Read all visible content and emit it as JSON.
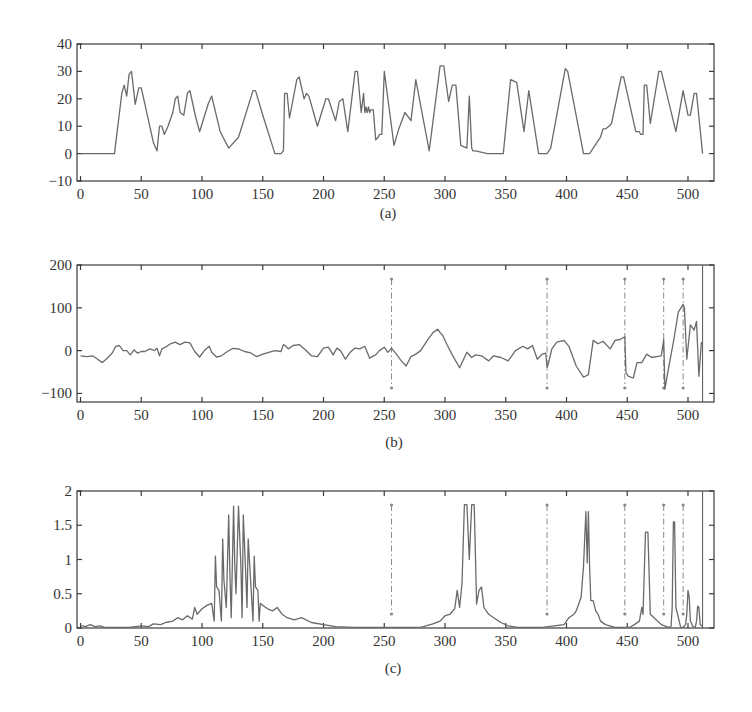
{
  "figure": {
    "panels": [
      "(a)",
      "(b)",
      "(c)"
    ]
  },
  "chart_data": [
    {
      "type": "line",
      "panel_label": "(a)",
      "title": "",
      "xlabel": "",
      "ylabel": "",
      "xlim": [
        -3,
        520
      ],
      "ylim": [
        -10,
        40
      ],
      "xticks": [
        0,
        50,
        100,
        150,
        200,
        250,
        300,
        350,
        400,
        450,
        500
      ],
      "yticks": [
        -10,
        0,
        10,
        20,
        30,
        40
      ],
      "ytick_labels": [
        "−10",
        "0",
        "10",
        "20",
        "30",
        "40"
      ],
      "grid": false,
      "series": [
        {
          "name": "signal",
          "x": [
            0,
            28,
            34,
            36,
            38,
            40,
            42,
            45,
            48,
            50,
            55,
            60,
            63,
            65,
            67,
            69,
            72,
            76,
            78,
            80,
            82,
            85,
            88,
            90,
            95,
            98,
            105,
            108,
            115,
            122,
            130,
            142,
            144,
            150,
            160,
            165,
            167,
            168,
            170,
            172,
            178,
            180,
            184,
            186,
            188,
            195,
            202,
            204,
            210,
            213,
            216,
            220,
            226,
            228,
            231,
            233,
            234,
            235,
            236,
            237,
            238,
            239,
            240,
            241,
            243,
            245,
            246,
            248,
            250,
            258,
            262,
            267,
            272,
            276,
            287,
            296,
            299,
            303,
            306,
            309,
            313,
            318,
            320,
            322,
            323,
            325,
            335,
            348,
            354,
            359,
            365,
            369,
            377,
            384,
            387,
            399,
            401,
            414,
            419,
            428,
            430,
            432,
            435,
            437,
            445,
            447,
            457,
            460,
            461,
            463,
            464,
            466,
            469,
            476,
            478,
            490,
            496,
            500,
            502,
            505,
            507,
            512
          ],
          "y": [
            0,
            0,
            22,
            25,
            21,
            29,
            30,
            18,
            24,
            24,
            14,
            4,
            1,
            10,
            10,
            7,
            10,
            15,
            20,
            21,
            15,
            14,
            22,
            23,
            13,
            8,
            18,
            21,
            8,
            2,
            6,
            23,
            23,
            14,
            0,
            0,
            1,
            22,
            22,
            13,
            27,
            28,
            20,
            22,
            21,
            10,
            20,
            20,
            12,
            19,
            20,
            8,
            30,
            30,
            15,
            22,
            15,
            17,
            15,
            17,
            15,
            16,
            16,
            16,
            5,
            6,
            7,
            7,
            30,
            3,
            9,
            15,
            12,
            27,
            1,
            32,
            32,
            19,
            25,
            25,
            3,
            2,
            21,
            2,
            1,
            1,
            0,
            0,
            27,
            26,
            8,
            23,
            0,
            0,
            2,
            31,
            30,
            0,
            0,
            6,
            9,
            9,
            10,
            11,
            28,
            28,
            8,
            8,
            7,
            7,
            25,
            25,
            11,
            30,
            30,
            8,
            23,
            14,
            14,
            22,
            22,
            0
          ]
        }
      ]
    },
    {
      "type": "line",
      "panel_label": "(b)",
      "title": "",
      "xlabel": "",
      "ylabel": "",
      "xlim": [
        -3,
        520
      ],
      "ylim": [
        -120,
        200
      ],
      "xticks": [
        0,
        50,
        100,
        150,
        200,
        250,
        300,
        350,
        400,
        450,
        500
      ],
      "yticks": [
        -100,
        0,
        100,
        200
      ],
      "ytick_labels": [
        "−100",
        "0",
        "100",
        "200"
      ],
      "grid": false,
      "vertical_markers": [
        256,
        384,
        448,
        480,
        496,
        512
      ],
      "series": [
        {
          "name": "detail",
          "x": [
            0,
            5,
            10,
            15,
            18,
            22,
            26,
            29,
            32,
            35,
            38,
            41,
            44,
            47,
            50,
            53,
            57,
            61,
            63,
            65,
            67,
            70,
            74,
            78,
            82,
            86,
            90,
            94,
            98,
            102,
            106,
            108,
            112,
            116,
            120,
            125,
            130,
            135,
            140,
            145,
            150,
            155,
            160,
            165,
            167,
            169,
            171,
            175,
            180,
            185,
            190,
            195,
            200,
            204,
            208,
            211,
            214,
            218,
            222,
            226,
            230,
            234,
            236,
            238,
            240,
            243,
            246,
            250,
            253,
            256,
            260,
            264,
            268,
            272,
            276,
            280,
            285,
            290,
            294,
            296,
            298,
            302,
            306,
            312,
            318,
            322,
            325,
            330,
            336,
            340,
            346,
            352,
            358,
            364,
            368,
            372,
            376,
            380,
            383,
            384,
            385,
            388,
            392,
            398,
            402,
            408,
            414,
            418,
            422,
            426,
            430,
            436,
            440,
            444,
            448,
            449,
            451,
            455,
            458,
            462,
            466,
            470,
            474,
            478,
            480,
            481,
            484,
            488,
            492,
            496,
            497,
            499,
            502,
            505,
            507,
            509,
            511
          ],
          "y": [
            -12,
            -14,
            -12,
            -22,
            -28,
            -18,
            -6,
            10,
            12,
            0,
            0,
            -10,
            2,
            -6,
            -2,
            -2,
            4,
            0,
            6,
            -12,
            4,
            8,
            16,
            20,
            14,
            20,
            18,
            -2,
            -15,
            0,
            10,
            -4,
            -15,
            -12,
            -4,
            5,
            4,
            -2,
            -5,
            -14,
            -8,
            -4,
            0,
            -2,
            14,
            10,
            4,
            12,
            14,
            2,
            -12,
            -14,
            6,
            8,
            -10,
            6,
            0,
            -20,
            -4,
            6,
            4,
            10,
            -4,
            -18,
            -14,
            -10,
            0,
            8,
            -4,
            6,
            -8,
            -24,
            -36,
            -14,
            -8,
            0,
            22,
            42,
            50,
            42,
            36,
            12,
            -10,
            -40,
            -4,
            -16,
            -10,
            -12,
            -24,
            -12,
            -16,
            -24,
            0,
            10,
            4,
            12,
            -20,
            -8,
            -6,
            -40,
            -30,
            4,
            20,
            24,
            10,
            -36,
            -62,
            -56,
            24,
            16,
            22,
            4,
            24,
            26,
            32,
            -52,
            -60,
            -64,
            -28,
            -28,
            -8,
            -16,
            -14,
            -12,
            26,
            -90,
            -40,
            20,
            90,
            108,
            100,
            -20,
            60,
            48,
            68,
            -60,
            20
          ]
        }
      ]
    },
    {
      "type": "line",
      "panel_label": "(c)",
      "title": "",
      "xlabel": "",
      "ylabel": "",
      "xlim": [
        -3,
        520
      ],
      "ylim": [
        0,
        2
      ],
      "xticks": [
        0,
        50,
        100,
        150,
        200,
        250,
        300,
        350,
        400,
        450,
        500
      ],
      "yticks": [
        0,
        0.5,
        1,
        1.5,
        2
      ],
      "ytick_labels": [
        "0",
        "0.5",
        "1",
        "1.5",
        "2"
      ],
      "grid": false,
      "vertical_markers": [
        256,
        384,
        448,
        480,
        496,
        512
      ],
      "series": [
        {
          "name": "magnitude",
          "x": [
            0,
            4,
            8,
            12,
            16,
            20,
            30,
            40,
            50,
            56,
            60,
            66,
            70,
            76,
            80,
            84,
            88,
            92,
            94,
            96,
            100,
            104,
            108,
            110,
            111,
            112,
            114,
            116,
            117,
            118,
            120,
            122,
            123,
            124,
            126,
            127,
            128,
            130,
            132,
            133,
            134,
            136,
            137,
            138,
            140,
            142,
            143,
            144,
            146,
            147,
            148,
            150,
            154,
            158,
            162,
            166,
            170,
            176,
            182,
            190,
            200,
            210,
            225,
            240,
            260,
            280,
            290,
            296,
            300,
            304,
            308,
            310,
            312,
            314,
            316,
            318,
            320,
            322,
            324,
            326,
            328,
            330,
            332,
            336,
            340,
            346,
            352,
            360,
            380,
            398,
            402,
            406,
            408,
            410,
            412,
            414,
            416,
            417,
            418,
            419,
            420,
            422,
            424,
            426,
            428,
            432,
            440,
            452,
            456,
            460,
            462,
            463,
            465,
            467,
            469,
            472,
            478,
            484,
            486,
            487,
            488,
            489,
            490,
            494,
            496,
            498,
            499,
            500,
            501,
            502,
            504,
            506,
            507,
            508,
            509,
            510,
            512
          ],
          "y": [
            0.04,
            0.02,
            0.05,
            0.02,
            0.03,
            0.01,
            0.01,
            0.01,
            0.03,
            0.02,
            0.06,
            0.05,
            0.08,
            0.1,
            0.15,
            0.12,
            0.18,
            0.13,
            0.3,
            0.2,
            0.28,
            0.33,
            0.36,
            0.1,
            1.05,
            0.6,
            0.55,
            0.1,
            1.3,
            0.7,
            0.3,
            1.65,
            0.8,
            0.15,
            1.78,
            0.9,
            0.5,
            1.78,
            0.9,
            0.15,
            1.65,
            0.8,
            0.3,
            1.3,
            0.7,
            0.1,
            1.05,
            0.6,
            0.55,
            0.1,
            0.36,
            0.33,
            0.28,
            0.25,
            0.3,
            0.2,
            0.15,
            0.12,
            0.15,
            0.08,
            0.05,
            0.02,
            0.01,
            0.01,
            0.01,
            0.01,
            0.06,
            0.1,
            0.18,
            0.2,
            0.28,
            0.55,
            0.3,
            0.65,
            1.8,
            1.8,
            1.0,
            1.8,
            1.8,
            0.35,
            0.55,
            0.6,
            0.3,
            0.2,
            0.15,
            0.08,
            0.03,
            0.01,
            0.01,
            0.05,
            0.15,
            0.2,
            0.25,
            0.35,
            0.45,
            0.9,
            1.7,
            0.95,
            1.7,
            0.9,
            0.4,
            0.4,
            0.25,
            0.2,
            0.1,
            0.05,
            0.01,
            0.01,
            0.05,
            0.1,
            0.3,
            0.2,
            1.4,
            1.4,
            0.2,
            0.15,
            0.05,
            0.01,
            0.02,
            0.3,
            1.55,
            1.55,
            0.3,
            0.01,
            0.01,
            0.05,
            0.2,
            0.55,
            0.45,
            0.1,
            0.02,
            0.01,
            0.1,
            0.32,
            0.3,
            0.05,
            0.02
          ]
        }
      ]
    }
  ]
}
